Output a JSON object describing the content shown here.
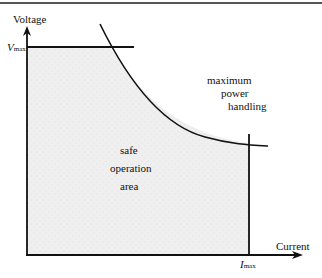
{
  "diagram": {
    "type": "safe-operating-area",
    "axes": {
      "y_label": "Voltage",
      "x_label": "Current"
    },
    "markers": {
      "v_max": {
        "symbol": "V",
        "subscript": "max"
      },
      "i_max": {
        "symbol": "I",
        "subscript": "max"
      }
    },
    "curve_label": [
      "maximum",
      "power",
      "handling"
    ],
    "region_label": [
      "safe",
      "operation",
      "area"
    ],
    "colors": {
      "line": "#111111",
      "shaded_area": "#ececec",
      "background": "#ffffff"
    }
  }
}
